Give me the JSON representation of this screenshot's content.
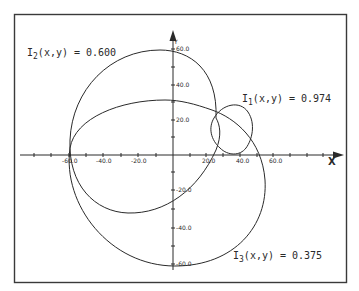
{
  "figure": {
    "axes": {
      "x_label": "X",
      "y_label": "Y",
      "x_ticks": [
        "-60.0",
        "-40.0",
        "-20.0",
        "20.0",
        "40.0",
        "60.0"
      ],
      "y_ticks": [
        "60.0",
        "40.0",
        "20.0",
        "-20.0",
        "-40.0",
        "-60.0"
      ]
    },
    "curves": [
      {
        "id": "I1",
        "label_main": "I",
        "label_sub": "1",
        "label_rest": "(x,y) = 0.974"
      },
      {
        "id": "I2",
        "label_main": "I",
        "label_sub": "2",
        "label_rest": "(x,y) = 0.600"
      },
      {
        "id": "I3",
        "label_main": "I",
        "label_sub": "3",
        "label_rest": "(x,y) = 0.375"
      }
    ],
    "colors": {
      "line": "#2a2a2a",
      "frame": "#3a3a3a",
      "background": "#ffffff"
    }
  }
}
